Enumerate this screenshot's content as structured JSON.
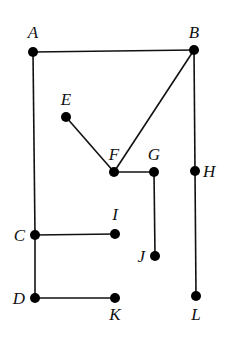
{
  "diagram": {
    "type": "graph",
    "nodes": [
      {
        "id": "A",
        "label": "A",
        "x": 33,
        "y": 52,
        "lx": 33,
        "ly": 38,
        "anchor": "middle"
      },
      {
        "id": "B",
        "label": "B",
        "x": 194,
        "y": 50,
        "lx": 194,
        "ly": 38,
        "anchor": "middle"
      },
      {
        "id": "E",
        "label": "E",
        "x": 66,
        "y": 117,
        "lx": 66,
        "ly": 105,
        "anchor": "middle"
      },
      {
        "id": "F",
        "label": "F",
        "x": 114,
        "y": 172,
        "lx": 114,
        "ly": 160,
        "anchor": "middle"
      },
      {
        "id": "G",
        "label": "G",
        "x": 154,
        "y": 172,
        "lx": 154,
        "ly": 160,
        "anchor": "middle"
      },
      {
        "id": "H",
        "label": "H",
        "x": 195,
        "y": 171,
        "lx": 203,
        "ly": 177,
        "anchor": "start"
      },
      {
        "id": "C",
        "label": "C",
        "x": 35,
        "y": 235,
        "lx": 25,
        "ly": 241,
        "anchor": "end"
      },
      {
        "id": "I",
        "label": "I",
        "x": 115,
        "y": 234,
        "lx": 115,
        "ly": 220,
        "anchor": "middle"
      },
      {
        "id": "J",
        "label": "J",
        "x": 155,
        "y": 256,
        "lx": 145,
        "ly": 262,
        "anchor": "end"
      },
      {
        "id": "D",
        "label": "D",
        "x": 35,
        "y": 298,
        "lx": 25,
        "ly": 304,
        "anchor": "end"
      },
      {
        "id": "K",
        "label": "K",
        "x": 115,
        "y": 298,
        "lx": 115,
        "ly": 320,
        "anchor": "middle"
      },
      {
        "id": "L",
        "label": "L",
        "x": 196,
        "y": 296,
        "lx": 196,
        "ly": 320,
        "anchor": "middle"
      }
    ],
    "edges": [
      [
        "A",
        "B"
      ],
      [
        "A",
        "C"
      ],
      [
        "C",
        "D"
      ],
      [
        "C",
        "I"
      ],
      [
        "D",
        "K"
      ],
      [
        "B",
        "F"
      ],
      [
        "B",
        "H"
      ],
      [
        "H",
        "L"
      ],
      [
        "E",
        "F"
      ],
      [
        "F",
        "G"
      ],
      [
        "G",
        "J"
      ]
    ],
    "colors": {
      "node": "#000000",
      "edge": "#111111",
      "background": "#ffffff"
    }
  }
}
